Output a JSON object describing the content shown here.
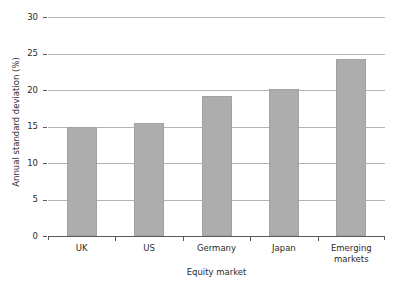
{
  "chart_data": {
    "type": "bar",
    "title": "",
    "subtitle": "",
    "xlabel": "Equity market",
    "ylabel": "Annual standard deviation (%)",
    "categories": [
      "UK",
      "US",
      "Germany",
      "Japan",
      "Emerging markets"
    ],
    "values": [
      15.0,
      15.5,
      19.2,
      20.2,
      24.3
    ],
    "series": [
      {
        "name": "Annual standard deviation",
        "values": [
          15.0,
          15.5,
          19.2,
          20.2,
          24.3
        ]
      }
    ],
    "ylim": [
      0,
      30
    ],
    "xlim": [
      0,
      5
    ],
    "y_ticks": [
      0,
      5,
      10,
      15,
      20,
      25,
      30
    ],
    "y_tick_labels": [
      "0",
      "5",
      "10",
      "15",
      "20",
      "25",
      "30"
    ],
    "grid": true,
    "grid_axis": "y",
    "legend": false,
    "legend_position": "none",
    "bar_color": "#adadad",
    "bar_edge_color": "#a2a2a2",
    "gridline_color": "#b4b4b4",
    "axis_color": "#5a5a5a",
    "text_color": "#2b2b2b",
    "background_color": "#ffffff",
    "annotations": []
  },
  "axes": {
    "y": {
      "title": "Annual standard deviation (%)",
      "ticks": [
        {
          "label": "30",
          "value": 30
        },
        {
          "label": "25",
          "value": 25
        },
        {
          "label": "20",
          "value": 20
        },
        {
          "label": "15",
          "value": 15
        },
        {
          "label": "10",
          "value": 10
        },
        {
          "label": "5",
          "value": 5
        },
        {
          "label": "0",
          "value": 0
        }
      ]
    },
    "x": {
      "title": "Equity market",
      "ticks": [
        {
          "label": "UK",
          "lines": [
            "UK"
          ]
        },
        {
          "label": "US",
          "lines": [
            "US"
          ]
        },
        {
          "label": "Germany",
          "lines": [
            "Germany"
          ]
        },
        {
          "label": "Japan",
          "lines": [
            "Japan"
          ]
        },
        {
          "label": "Emerging markets",
          "lines": [
            "Emerging",
            "markets"
          ]
        }
      ]
    }
  }
}
